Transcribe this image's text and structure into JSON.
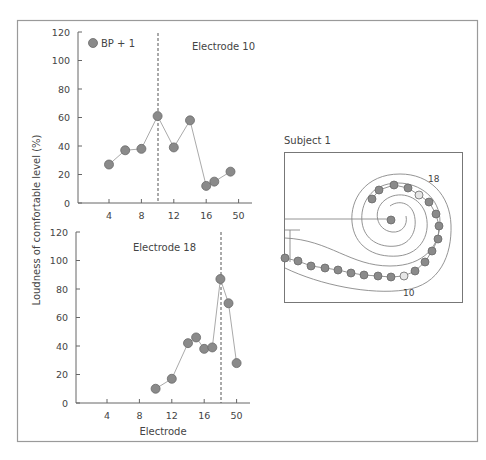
{
  "figure": {
    "outer_border": {
      "x": 17,
      "y": 20,
      "w": 461,
      "h": 422
    },
    "ylabel": "Loudness of comfortable level (%)",
    "xlabel": "Electrode",
    "legend": {
      "label": "BP + 1",
      "marker_color": "#8a8a8a"
    },
    "subject_label": "Subject 1"
  },
  "chart_data": [
    {
      "type": "line",
      "title": "Electrode 10",
      "series": [
        {
          "name": "BP + 1",
          "x_pos": [
            4,
            6,
            8,
            10,
            12,
            14,
            16,
            17,
            19
          ],
          "values": [
            27,
            37,
            38,
            61,
            39,
            58,
            12,
            15,
            22
          ]
        }
      ],
      "xticks": [
        "4",
        "8",
        "12",
        "16",
        "50"
      ],
      "yticks": [
        "0",
        "20",
        "40",
        "60",
        "80",
        "100",
        "120"
      ],
      "ylim": [
        0,
        120
      ],
      "reference_line_x": 10,
      "legend": "BP + 1",
      "legend_position": "top-left",
      "grid": false
    },
    {
      "type": "line",
      "title": "Electrode 18",
      "series": [
        {
          "name": "BP + 1",
          "x_pos": [
            10,
            12,
            14,
            15,
            16,
            17,
            18,
            19,
            20
          ],
          "values": [
            10,
            17,
            42,
            46,
            38,
            39,
            87,
            70,
            28
          ]
        }
      ],
      "xticks": [
        "4",
        "8",
        "12",
        "16",
        "50"
      ],
      "yticks": [
        "0",
        "20",
        "40",
        "60",
        "80",
        "100",
        "120"
      ],
      "ylim": [
        0,
        120
      ],
      "reference_line_x": 18,
      "xlabel": "Electrode",
      "ylabel": "Loudness of comfortable level (%)",
      "grid": false
    }
  ],
  "cochlea": {
    "title": "Subject 1",
    "label_10": "10",
    "label_18": "18",
    "highlight_color": "#e6e6e6",
    "electrode_color": "#8a8a8a"
  }
}
